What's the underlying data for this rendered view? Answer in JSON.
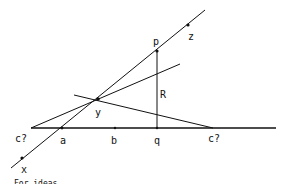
{
  "diagram": {
    "stroke_color": "#111111",
    "background": "#ffffff",
    "labels": {
      "p": "p",
      "z": "z",
      "R": "R",
      "y": "y",
      "c_left": "c?",
      "a": "a",
      "b": "b",
      "q": "q",
      "c_right": "c?",
      "x": "x"
    },
    "caption": "For ideas ..."
  }
}
